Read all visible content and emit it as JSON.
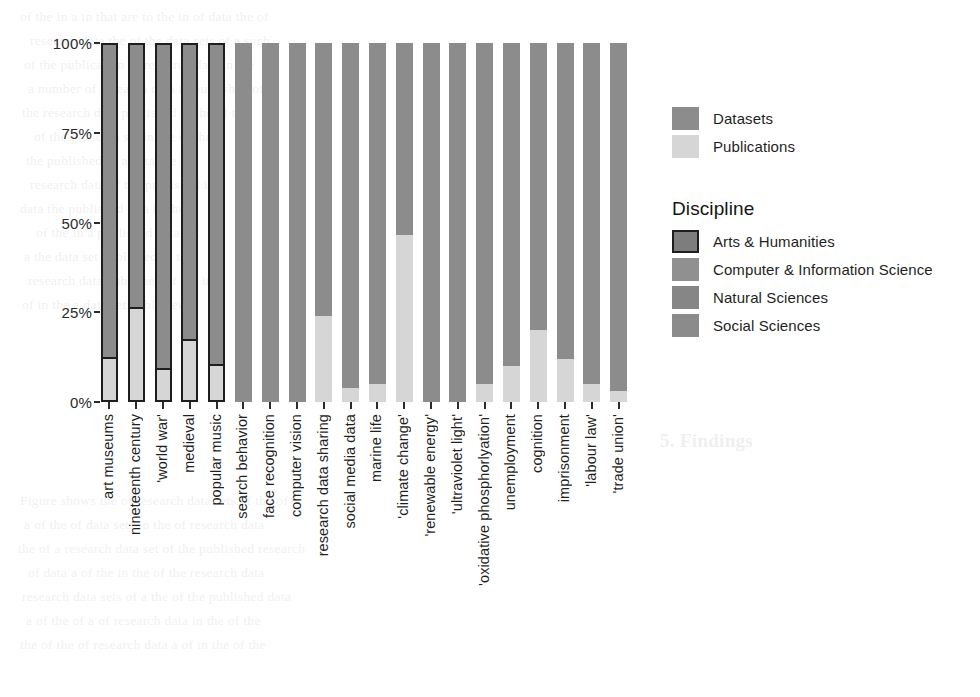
{
  "chart_data": {
    "type": "bar",
    "subtype": "stacked-percent",
    "title": "",
    "xlabel": "",
    "ylabel": "",
    "ylim": [
      0,
      100
    ],
    "ytick_labels": [
      "0%",
      "25%",
      "50%",
      "75%",
      "100%"
    ],
    "ytick_values": [
      0,
      25,
      50,
      75,
      100
    ],
    "grid": false,
    "stack_order": [
      "Datasets",
      "Publications"
    ],
    "categories": [
      "art museums",
      "nineteenth century",
      "'world war'",
      "medieval",
      "popular music",
      "search behavior",
      "face recognition",
      "computer vision",
      "research data sharing",
      "social media data",
      "marine life",
      "'climate change'",
      "'renewable energy'",
      "'ultraviolet light'",
      "'oxidative phosphorlyation'",
      "unemployment",
      "cognition",
      "imprisonment",
      "'labour law'",
      "'trade union'"
    ],
    "series": [
      {
        "name": "Datasets",
        "values": [
          88,
          74,
          91,
          83,
          90,
          100,
          100,
          100,
          76,
          96,
          95,
          53.5,
          100,
          100,
          95,
          90,
          80,
          88,
          95,
          97
        ]
      },
      {
        "name": "Publications",
        "values": [
          12,
          26,
          9,
          17,
          10,
          0,
          0,
          0,
          24,
          4,
          5,
          46.5,
          0,
          0,
          5,
          10,
          20,
          12,
          5,
          3
        ]
      }
    ],
    "discipline_of_category": [
      "Arts & Humanities",
      "Arts & Humanities",
      "Arts & Humanities",
      "Arts & Humanities",
      "Arts & Humanities",
      "Computer & Information Science",
      "Computer & Information Science",
      "Computer & Information Science",
      "Computer & Information Science",
      "Computer & Information Science",
      "Natural Sciences",
      "Natural Sciences",
      "Natural Sciences",
      "Natural Sciences",
      "Natural Sciences",
      "Social Sciences",
      "Social Sciences",
      "Social Sciences",
      "Social Sciences",
      "Social Sciences"
    ]
  },
  "legend_fill": {
    "position": "right-top",
    "items": [
      {
        "label": "Datasets",
        "color": "#8c8c8c"
      },
      {
        "label": "Publications",
        "color": "#d6d6d6"
      }
    ]
  },
  "legend_discipline": {
    "title": "Discipline",
    "position": "right-middle",
    "items": [
      {
        "label": "Arts & Humanities",
        "color": "#7d7d7d",
        "outline": "#1e1e1e"
      },
      {
        "label": "Computer & Information Science",
        "color": "#909090",
        "outline": "none"
      },
      {
        "label": "Natural Sciences",
        "color": "#868686",
        "outline": "none"
      },
      {
        "label": "Social Sciences",
        "color": "#8b8b8b",
        "outline": "none"
      }
    ]
  },
  "colors": {
    "datasets": "#8c8c8c",
    "publications": "#d6d6d6",
    "outline": "#1e1e1e",
    "axis_text": "#2a2a2a",
    "background": "#ffffff"
  },
  "bleed_text": [
    "of the  in  a  in  that  are  to  the  in  of  data  the  of",
    "research  data  the  of  the  data  sets  of  a  such",
    "of  the  publication  of  research  data  in  the",
    "a  number  of  research  data  in  published  of",
    "the  research  data  published  in  the  of  the",
    "of  the  of  a  data  set  in  the  of  the",
    "the  published  of  a  data  the  in",
    "research  data  of  the  published  in",
    "data  the  published  of  a  in  the",
    "of  the  in  a  published  data  set",
    "a  the  data  set  published  of  the",
    "research  data  published  of  the  in",
    "of  in  the  a  data  set  published",
    "5. Findings",
    "Figure  shows  the  of  research  data  sets  of  the  of",
    "a  of  the  of  data  sets  in  the  of  research  data",
    "the  of  a  research  data  set  of  the  published  research",
    "of  data  a  of  the  in  the  of  the  research  data",
    "research  data  sets  of  a  the  of  the  published  data",
    "a  of  the  of  a  of  research  data  in  the  of  the",
    "the  of  the  of  research  data  a  of  in  the  of  the"
  ]
}
